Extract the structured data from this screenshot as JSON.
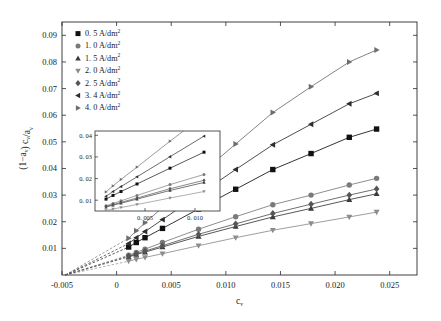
{
  "chart_data": {
    "type": "scatter",
    "title": "",
    "xlabel": "c_v",
    "ylabel": "(1-a_v) c_v/a_v",
    "xlim": [
      -0.005,
      0.0275
    ],
    "ylim": [
      0,
      0.095
    ],
    "xticks": [
      "-0.005",
      "0",
      "0.005",
      "0.010",
      "0.015",
      "0.020",
      "0.025"
    ],
    "xtick_values": [
      -0.005,
      0,
      0.005,
      0.01,
      0.015,
      0.02,
      0.025
    ],
    "yticks": [
      "0.01",
      "0.02",
      "0.03",
      "0.04",
      "0.05",
      "0.06",
      "0.07",
      "0.08",
      "0.09"
    ],
    "ytick_values": [
      0.01,
      0.02,
      0.03,
      0.04,
      0.05,
      0.06,
      0.07,
      0.08,
      0.09
    ],
    "grid": false,
    "legend_position": "top-left",
    "series": [
      {
        "name": "0. 5 A/dm",
        "exponent": "2",
        "marker": "square",
        "color": "#111111",
        "x": [
          0.0011,
          0.0018,
          0.0026,
          0.0042,
          0.0075,
          0.0109,
          0.0143,
          0.0178,
          0.0213,
          0.0238
        ],
        "y": [
          0.0105,
          0.0122,
          0.014,
          0.0175,
          0.0248,
          0.0322,
          0.0396,
          0.0456,
          0.0517,
          0.0548
        ]
      },
      {
        "name": "1. 0 A/dm",
        "exponent": "2",
        "marker": "circle",
        "color": "#7a7a7a",
        "x": [
          0.0011,
          0.0018,
          0.0026,
          0.0042,
          0.0075,
          0.0109,
          0.0143,
          0.0178,
          0.0213,
          0.0238
        ],
        "y": [
          0.0074,
          0.0085,
          0.0097,
          0.0122,
          0.0172,
          0.0219,
          0.0264,
          0.03,
          0.0338,
          0.0363
        ]
      },
      {
        "name": "1. 5 A/dm",
        "exponent": "2",
        "marker": "triangle-up",
        "color": "#3a3a3a",
        "x": [
          0.0011,
          0.0018,
          0.0026,
          0.0042,
          0.0075,
          0.0109,
          0.0143,
          0.0178,
          0.0213,
          0.0238
        ],
        "y": [
          0.0068,
          0.0077,
          0.0086,
          0.0105,
          0.0145,
          0.0182,
          0.0218,
          0.025,
          0.0283,
          0.0305
        ]
      },
      {
        "name": "2. 0 A/dm",
        "exponent": "2",
        "marker": "triangle-down",
        "color": "#8c8c8c",
        "x": [
          0.0011,
          0.0018,
          0.0026,
          0.0042,
          0.0075,
          0.0109,
          0.0143,
          0.0178,
          0.0213,
          0.0238
        ],
        "y": [
          0.0052,
          0.0059,
          0.0066,
          0.008,
          0.011,
          0.014,
          0.0168,
          0.0193,
          0.0218,
          0.0236
        ]
      },
      {
        "name": "2. 5 A/dm",
        "exponent": "2",
        "marker": "diamond",
        "color": "#555555",
        "x": [
          0.0011,
          0.0018,
          0.0026,
          0.0042,
          0.0075,
          0.0109,
          0.0143,
          0.0178,
          0.0213,
          0.0238
        ],
        "y": [
          0.0071,
          0.008,
          0.009,
          0.011,
          0.0153,
          0.0192,
          0.0231,
          0.0266,
          0.03,
          0.0323
        ]
      },
      {
        "name": "3. 4 A/dm",
        "exponent": "2",
        "marker": "triangle-left",
        "color": "#2e2e2e",
        "x": [
          0.0011,
          0.0018,
          0.0026,
          0.0042,
          0.0075,
          0.0109,
          0.0143,
          0.0178,
          0.0213,
          0.0238
        ],
        "y": [
          0.0118,
          0.014,
          0.0163,
          0.0208,
          0.0301,
          0.0396,
          0.0489,
          0.0566,
          0.0643,
          0.0682
        ]
      },
      {
        "name": "4. 0 A/dm",
        "exponent": "2",
        "marker": "triangle-right",
        "color": "#6e6e6e",
        "x": [
          0.0011,
          0.0018,
          0.0026,
          0.0042,
          0.0075,
          0.0109,
          0.0143,
          0.0178,
          0.0213,
          0.0238
        ],
        "y": [
          0.0138,
          0.0166,
          0.0196,
          0.0253,
          0.0373,
          0.0492,
          0.061,
          0.0707,
          0.08,
          0.0845
        ]
      }
    ],
    "extrapolation": {
      "style": "dashed",
      "converge_x": -0.0047,
      "converge_y": 0.0
    },
    "inset": {
      "type": "scatter",
      "xlim": [
        0.0,
        0.0125
      ],
      "ylim": [
        0.005,
        0.042
      ],
      "xticks": [
        "0. 005",
        "0. 010"
      ],
      "xtick_values": [
        0.005,
        0.01
      ],
      "yticks": [
        "0. 01",
        "0. 02",
        "0. 03",
        "0. 04"
      ],
      "ytick_values": [
        0.01,
        0.02,
        0.03,
        0.04
      ],
      "grid": false
    }
  }
}
